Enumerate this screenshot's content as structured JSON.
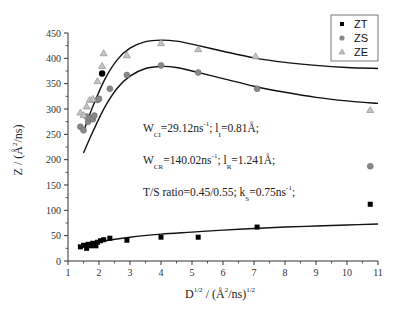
{
  "chart_data": {
    "type": "scatter",
    "title": "",
    "xlabel": "D^{1/2} / (Å^2/ns)^{1/2}",
    "ylabel": "Z / (Å^2/ns)",
    "xlim": [
      1,
      11
    ],
    "ylim": [
      0,
      450
    ],
    "x_ticks": [
      1,
      2,
      3,
      4,
      5,
      6,
      7,
      8,
      9,
      10,
      11
    ],
    "y_ticks": [
      0,
      50,
      100,
      150,
      200,
      250,
      300,
      350,
      400,
      450
    ],
    "grid": false,
    "legend_position": "top-right",
    "series": [
      {
        "name": "ZT",
        "marker": "square",
        "color": "#000000",
        "points": [
          [
            1.4,
            28
          ],
          [
            1.5,
            31
          ],
          [
            1.6,
            25
          ],
          [
            1.65,
            33
          ],
          [
            1.75,
            30
          ],
          [
            1.8,
            35
          ],
          [
            1.9,
            30
          ],
          [
            1.95,
            37
          ],
          [
            2.05,
            40
          ],
          [
            2.15,
            42
          ],
          [
            2.35,
            45
          ],
          [
            2.9,
            41
          ],
          [
            4.0,
            47
          ],
          [
            5.2,
            47
          ],
          [
            7.1,
            67
          ],
          [
            10.75,
            112
          ]
        ],
        "fit": [
          [
            1.4,
            30
          ],
          [
            2,
            38
          ],
          [
            3,
            47
          ],
          [
            4,
            53
          ],
          [
            5,
            57
          ],
          [
            6,
            61
          ],
          [
            7,
            64
          ],
          [
            8,
            67
          ],
          [
            9,
            69
          ],
          [
            10,
            71
          ],
          [
            11,
            73
          ]
        ]
      },
      {
        "name": "ZS",
        "marker": "circle",
        "color": "#888888",
        "points": [
          [
            1.4,
            265
          ],
          [
            1.5,
            258
          ],
          [
            1.6,
            285
          ],
          [
            1.65,
            275
          ],
          [
            1.7,
            282
          ],
          [
            1.8,
            280
          ],
          [
            1.85,
            287
          ],
          [
            1.95,
            318
          ],
          [
            2.0,
            320
          ],
          [
            2.35,
            340
          ],
          [
            2.9,
            367
          ],
          [
            4.0,
            386
          ],
          [
            5.2,
            372
          ],
          [
            7.1,
            340
          ],
          [
            10.75,
            187
          ]
        ],
        "fit": [
          [
            1.5,
            213
          ],
          [
            1.8,
            255
          ],
          [
            2.2,
            305
          ],
          [
            2.6,
            342
          ],
          [
            3.0,
            365
          ],
          [
            3.5,
            380
          ],
          [
            4.0,
            384
          ],
          [
            4.5,
            382
          ],
          [
            5.0,
            375
          ],
          [
            6.0,
            360
          ],
          [
            7.0,
            345
          ],
          [
            8.0,
            333
          ],
          [
            9.0,
            323
          ],
          [
            10.0,
            316
          ],
          [
            11.0,
            311
          ]
        ]
      },
      {
        "name": "ZE",
        "marker": "triangle",
        "color": "#999999",
        "points": [
          [
            1.4,
            293
          ],
          [
            1.5,
            288
          ],
          [
            1.6,
            305
          ],
          [
            1.7,
            318
          ],
          [
            1.8,
            320
          ],
          [
            1.95,
            355
          ],
          [
            2.1,
            385
          ],
          [
            2.15,
            410
          ],
          [
            2.9,
            406
          ],
          [
            4.0,
            430
          ],
          [
            5.2,
            418
          ],
          [
            7.05,
            404
          ],
          [
            10.75,
            298
          ]
        ],
        "fit": [
          [
            1.5,
            255
          ],
          [
            1.8,
            305
          ],
          [
            2.2,
            360
          ],
          [
            2.6,
            398
          ],
          [
            3.0,
            420
          ],
          [
            3.5,
            433
          ],
          [
            4.0,
            436
          ],
          [
            4.5,
            434
          ],
          [
            5.0,
            428
          ],
          [
            6.0,
            414
          ],
          [
            7.0,
            401
          ],
          [
            8.0,
            392
          ],
          [
            9.0,
            386
          ],
          [
            10.0,
            382
          ],
          [
            11.0,
            380
          ]
        ]
      }
    ],
    "highlight_point": {
      "x": 2.1,
      "y": 370,
      "color": "#000000",
      "marker": "circle"
    },
    "annotations": [
      {
        "text": "W_CI=29.12ns^-1; l_I=0.81Å;",
        "x": 4.0,
        "y": 245
      },
      {
        "text": "W_CR=140.02ns^-1; l_R=1.241Å;",
        "x": 4.0,
        "y": 185
      },
      {
        "text": "T/S ratio=0.45/0.55; k_S=0.75ns^-1;",
        "x": 4.0,
        "y": 135
      }
    ]
  },
  "legend": {
    "items": [
      {
        "label": "ZT",
        "marker": "square"
      },
      {
        "label": "ZS",
        "marker": "circle"
      },
      {
        "label": "ZE",
        "marker": "triangle"
      }
    ]
  },
  "axes": {
    "y_title_main": "Z / (Å",
    "y_title_sup": "2",
    "y_title_tail": "/ns)",
    "x_title_main": "D",
    "x_title_sup1": "1/2",
    "x_title_mid": " / (Å",
    "x_title_sup2": "2",
    "x_title_tail": "/ns)",
    "x_title_sup3": "1/2"
  },
  "annotation_lines": [
    {
      "w": "W",
      "w_sub": "CI",
      "val": "=29.12ns",
      "val_sup": "-1",
      "rest": "; l",
      "rest_sub": "I",
      "tail": "=0.81Å;"
    },
    {
      "w": "W",
      "w_sub": "CR",
      "val": "=140.02ns",
      "val_sup": "-1",
      "rest": "; l",
      "rest_sub": "R",
      "tail": "=1.241Å;"
    },
    {
      "w": "T/S ratio=0.45/0.55; k",
      "w_sub": "S",
      "val": "=0.75ns",
      "val_sup": "-1",
      "rest": ";",
      "rest_sub": "",
      "tail": ""
    }
  ]
}
